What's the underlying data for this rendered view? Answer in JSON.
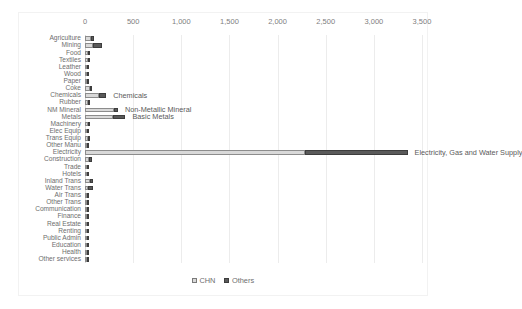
{
  "chart_data": {
    "type": "bar",
    "orientation": "horizontal",
    "stacked": true,
    "title": "",
    "xlabel": "",
    "ylabel": "",
    "xlim": [
      0,
      3500
    ],
    "xticks": [
      0,
      500,
      1000,
      1500,
      2000,
      2500,
      3000,
      3500
    ],
    "xticklabels": [
      "0",
      "500",
      "1,000",
      "1,500",
      "2,000",
      "2,500",
      "3,000",
      "3,500"
    ],
    "grid": true,
    "legend": {
      "position": "bottom-center",
      "entries": [
        {
          "name": "CHN",
          "color": "#d9d9d9"
        },
        {
          "name": "Others",
          "color": "#5a5a5a"
        }
      ]
    },
    "categories": [
      "Agriculture",
      "Mining",
      "Food",
      "Textiles",
      "Leather",
      "Wood",
      "Paper",
      "Coke",
      "Chemicals",
      "Rubber",
      "NM Mineral",
      "Metals",
      "Machinery",
      "Elec Equip",
      "Trans Equip",
      "Other Manu",
      "Electricity",
      "Construction",
      "Trade",
      "Hotels",
      "Inland Trans",
      "Water Trans",
      "Air Trans",
      "Other Trans",
      "Communication",
      "Finance",
      "Real Estate",
      "Renting",
      "Public Admin",
      "Education",
      "Health",
      "Other services"
    ],
    "series": [
      {
        "name": "CHN",
        "color": "#d9d9d9",
        "values": [
          62,
          78,
          26,
          30,
          8,
          12,
          22,
          52,
          150,
          26,
          300,
          290,
          26,
          20,
          26,
          16,
          2280,
          46,
          16,
          10,
          48,
          30,
          14,
          16,
          12,
          8,
          6,
          6,
          10,
          6,
          6,
          20
        ]
      },
      {
        "name": "Others",
        "color": "#5a5a5a",
        "values": [
          30,
          96,
          16,
          26,
          6,
          6,
          12,
          24,
          70,
          14,
          42,
          130,
          16,
          14,
          18,
          10,
          1070,
          30,
          10,
          6,
          32,
          56,
          24,
          10,
          8,
          6,
          4,
          4,
          6,
          4,
          4,
          12
        ]
      }
    ],
    "annotations": [
      {
        "text": "Chemicals",
        "category": "Chemicals"
      },
      {
        "text": "Non-Metallic Mineral",
        "category": "NM Mineral"
      },
      {
        "text": "Basic Metals",
        "category": "Metals"
      },
      {
        "text": "Electricity, Gas and Water Supply",
        "category": "Electricity"
      }
    ]
  }
}
